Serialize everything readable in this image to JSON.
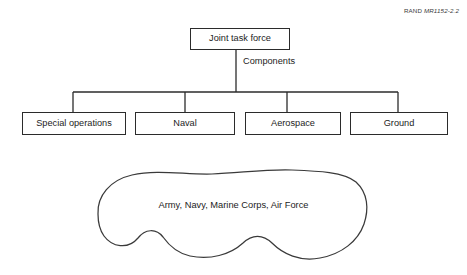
{
  "figure": {
    "credit_label": "RAND ",
    "credit_code": "MR1152-2.2"
  },
  "tree": {
    "root": {
      "label": "Joint task force"
    },
    "edge_label": "Components",
    "components": [
      {
        "label": "Special operations"
      },
      {
        "label": "Naval"
      },
      {
        "label": "Aerospace"
      },
      {
        "label": "Ground"
      }
    ]
  },
  "blob": {
    "caption": "Army, Navy, Marine Corps, Air Force"
  },
  "colors": {
    "stroke": "#2b2b2b",
    "blob_stroke": "#3a3a3a",
    "text": "#1c1c1c",
    "background": "#ffffff"
  }
}
